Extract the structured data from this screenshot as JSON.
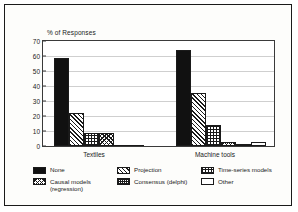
{
  "chart_data": {
    "type": "bar",
    "title": "",
    "ylabel": "% of Responses",
    "xlabel": "",
    "ylim": [
      0,
      70
    ],
    "yticks": [
      0,
      10,
      20,
      30,
      40,
      50,
      60,
      70
    ],
    "grid": true,
    "legend_position": "bottom",
    "categories": [
      "Textiles",
      "Machine tools"
    ],
    "series": [
      {
        "name": "None",
        "pattern": "solid",
        "values": [
          59,
          64
        ]
      },
      {
        "name": "Projection",
        "pattern": "diag",
        "values": [
          22,
          35.5
        ]
      },
      {
        "name": "Time-series models",
        "pattern": "grid",
        "values": [
          9,
          14
        ]
      },
      {
        "name": "Causal models\n(regression)",
        "pattern": "cross",
        "values": [
          9,
          3
        ]
      },
      {
        "name": "Consensus (delphi)",
        "pattern": "checker",
        "values": [
          0,
          1.5
        ]
      },
      {
        "name": "Other",
        "pattern": "empty",
        "values": [
          0,
          3
        ]
      }
    ]
  },
  "legend": {
    "items": [
      {
        "label": "None",
        "pattern": "solid"
      },
      {
        "label": "Projection",
        "pattern": "diag"
      },
      {
        "label": "Time-series models",
        "pattern": "grid"
      },
      {
        "label": "Causal models\n(regression)",
        "pattern": "cross"
      },
      {
        "label": "Consensus (delphi)",
        "pattern": "checker"
      },
      {
        "label": "Other",
        "pattern": "empty"
      }
    ]
  },
  "colors": {
    "ink": "#1a1a1a",
    "grid": "#cfcfcf",
    "background": "#ffffff",
    "frame": "#1a1a1a"
  }
}
